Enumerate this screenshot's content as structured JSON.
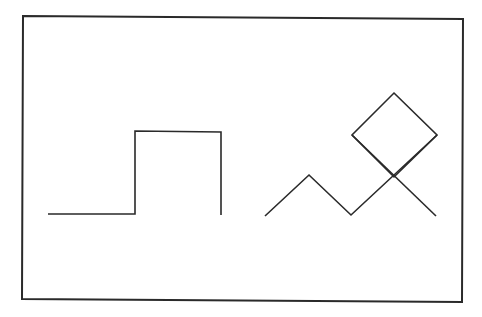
{
  "figure": {
    "background": "#ffffff",
    "stroke_color": "#2a2a2a",
    "frame": {
      "points": [
        [
          23,
          16
        ],
        [
          463,
          19
        ],
        [
          462,
          302
        ],
        [
          22,
          299
        ]
      ],
      "stroke_width": 2
    },
    "step_shape": {
      "points": [
        [
          48,
          214
        ],
        [
          135,
          214
        ],
        [
          135,
          131
        ],
        [
          221,
          132
        ],
        [
          221,
          215
        ]
      ],
      "stroke_width": 1.6
    },
    "zigzag": {
      "points": [
        [
          265,
          216
        ],
        [
          309,
          175
        ],
        [
          351,
          215
        ],
        [
          437,
          135
        ]
      ],
      "stroke_width": 1.6
    },
    "diamond": {
      "points": [
        [
          394,
          93
        ],
        [
          437,
          135
        ],
        [
          394,
          177
        ],
        [
          352,
          135
        ]
      ],
      "stroke_width": 1.6
    },
    "diamond_tail": {
      "points": [
        [
          352,
          135
        ],
        [
          436,
          216
        ]
      ],
      "stroke_width": 1.6
    }
  }
}
